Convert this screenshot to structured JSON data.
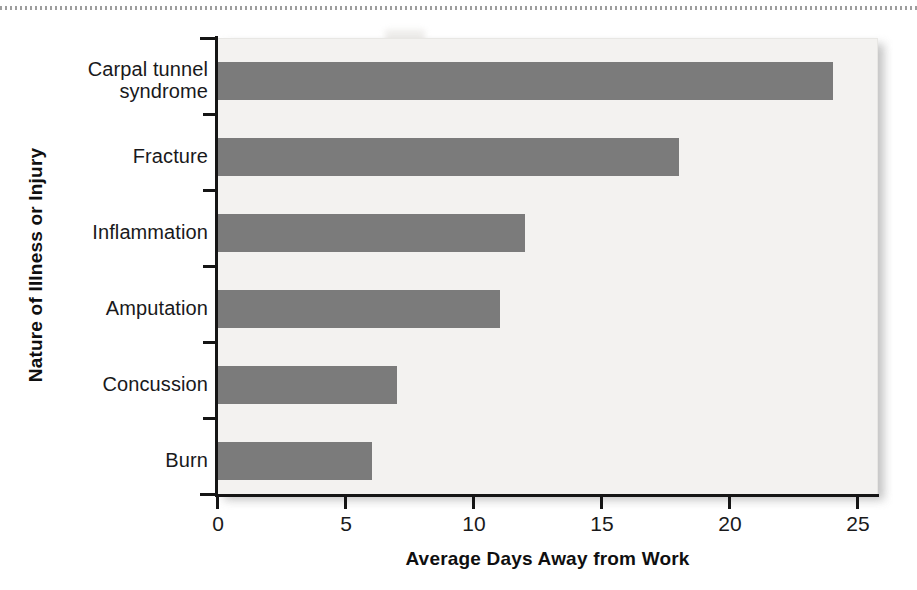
{
  "chart_data": {
    "type": "bar",
    "orientation": "horizontal",
    "title": "",
    "xlabel": "Average Days Away from Work",
    "ylabel": "Nature of Illness or Injury",
    "categories": [
      "Carpal tunnel syndrome",
      "Fracture",
      "Inflammation",
      "Amputation",
      "Concussion",
      "Burn"
    ],
    "category_labels_wrapped": [
      [
        "Carpal tunnel",
        "syndrome"
      ],
      [
        "Fracture"
      ],
      [
        "Inflammation"
      ],
      [
        "Amputation"
      ],
      [
        "Concussion"
      ],
      [
        "Burn"
      ]
    ],
    "values": [
      24,
      18,
      12,
      11,
      7,
      6
    ],
    "xlim": [
      0,
      25.8
    ],
    "xticks": [
      0,
      5,
      10,
      15,
      20,
      25
    ],
    "xtick_labels": [
      "0",
      "5",
      "10",
      "15",
      "20",
      "25"
    ],
    "grid": false,
    "legend": null,
    "bar_color": "#7b7b7b",
    "plot_background": "#f3f2f0",
    "axis_color": "#151515"
  },
  "axes": {
    "x": {
      "title": "Average Days Away from Work",
      "ticks": [
        "0",
        "5",
        "10",
        "15",
        "20",
        "25"
      ]
    },
    "y": {
      "title": "Nature of Illness or Injury"
    }
  }
}
